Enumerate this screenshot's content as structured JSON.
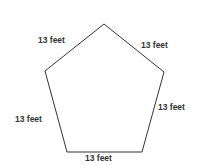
{
  "diagram": {
    "shape": "regular pentagon",
    "colors": {
      "stroke": "#333333",
      "text": "#333333",
      "background": "#ffffff"
    },
    "sides": [
      {
        "id": "top-left",
        "label": "13 feet"
      },
      {
        "id": "top-right",
        "label": "13 feet"
      },
      {
        "id": "right",
        "label": "13 feet"
      },
      {
        "id": "bottom",
        "label": "13 feet"
      },
      {
        "id": "left",
        "label": "13 feet"
      }
    ]
  }
}
